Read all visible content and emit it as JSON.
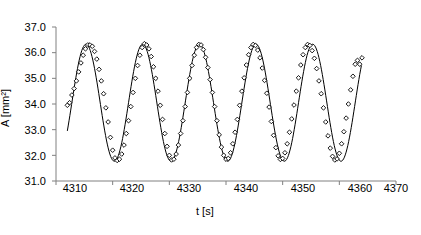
{
  "chart_data": {
    "type": "scatter",
    "title": "",
    "xlabel": "t [s]",
    "ylabel": "A [mm²]",
    "xlim": [
      4310,
      4370
    ],
    "ylim": [
      31.0,
      37.0
    ],
    "xticks": [
      4310,
      4320,
      4330,
      4340,
      4350,
      4360,
      4370
    ],
    "xtick_labels": [
      "4310",
      "4320",
      "4330",
      "4340",
      "4350",
      "4360",
      "4370"
    ],
    "yticks": [
      31.0,
      32.0,
      33.0,
      34.0,
      35.0,
      36.0,
      37.0
    ],
    "ytick_labels": [
      "31.0",
      "32.0",
      "33.0",
      "34.0",
      "35.0",
      "36.0",
      "37.0"
    ],
    "grid": false,
    "legend": "none",
    "series": [
      {
        "name": "measured",
        "marker": "open-diamond",
        "color": "#000000",
        "x": [
          4312.0,
          4312.4,
          4312.8,
          4313.2,
          4313.6,
          4314.0,
          4314.4,
          4314.8,
          4315.2,
          4315.6,
          4316.0,
          4316.4,
          4316.8,
          4317.2,
          4317.6,
          4318.0,
          4318.4,
          4318.8,
          4319.2,
          4319.6,
          4320.0,
          4320.4,
          4320.8,
          4321.2,
          4321.6,
          4322.0,
          4322.4,
          4322.8,
          4323.2,
          4323.6,
          4324.0,
          4324.4,
          4324.8,
          4325.2,
          4325.6,
          4326.0,
          4326.4,
          4326.8,
          4327.2,
          4327.6,
          4328.0,
          4328.4,
          4328.8,
          4329.2,
          4329.6,
          4330.0,
          4330.4,
          4330.8,
          4331.2,
          4331.6,
          4332.0,
          4332.4,
          4332.8,
          4333.2,
          4333.6,
          4334.0,
          4334.4,
          4334.8,
          4335.2,
          4335.6,
          4336.0,
          4336.4,
          4336.8,
          4337.2,
          4337.6,
          4338.0,
          4338.4,
          4338.8,
          4339.2,
          4339.6,
          4340.0,
          4340.4,
          4340.8,
          4341.2,
          4341.6,
          4342.0,
          4342.4,
          4342.8,
          4343.2,
          4343.6,
          4344.0,
          4344.4,
          4344.8,
          4345.2,
          4345.6,
          4346.0,
          4346.4,
          4346.8,
          4347.2,
          4347.6,
          4348.0,
          4348.4,
          4348.8,
          4349.2,
          4349.6,
          4350.0,
          4350.4,
          4350.8,
          4351.2,
          4351.6,
          4352.0,
          4352.4,
          4352.8,
          4353.2,
          4353.6,
          4354.0,
          4354.4,
          4354.8,
          4355.2,
          4355.6,
          4356.0,
          4356.4,
          4356.8,
          4357.2,
          4357.6,
          4358.0,
          4358.4,
          4358.8,
          4359.2,
          4359.6,
          4360.0,
          4360.4,
          4360.8,
          4361.2,
          4361.6,
          4362.0,
          4362.4,
          4362.8,
          4363.2,
          4363.6,
          4364.0
        ],
        "y": [
          33.95,
          34.05,
          34.35,
          34.6,
          34.9,
          35.25,
          35.6,
          35.9,
          36.15,
          36.3,
          36.3,
          36.25,
          36.05,
          35.75,
          35.35,
          34.9,
          34.4,
          33.85,
          33.3,
          32.7,
          32.2,
          31.9,
          31.8,
          31.85,
          32.05,
          32.4,
          32.85,
          33.35,
          33.9,
          34.45,
          35.0,
          35.5,
          35.9,
          36.2,
          36.35,
          36.3,
          36.15,
          35.85,
          35.45,
          35.0,
          34.5,
          33.95,
          33.4,
          32.85,
          32.35,
          32.0,
          31.82,
          31.85,
          32.05,
          32.4,
          32.85,
          33.35,
          33.9,
          34.45,
          35.0,
          35.5,
          35.9,
          36.2,
          36.32,
          36.3,
          36.12,
          35.82,
          35.42,
          34.95,
          34.45,
          33.9,
          33.35,
          32.8,
          32.32,
          32.0,
          31.85,
          31.88,
          32.1,
          32.45,
          32.9,
          33.4,
          33.95,
          34.5,
          35.02,
          35.52,
          35.92,
          36.2,
          36.32,
          36.28,
          36.1,
          35.8,
          35.4,
          34.92,
          34.42,
          33.88,
          33.32,
          32.78,
          32.3,
          31.98,
          31.84,
          31.88,
          32.1,
          32.45,
          32.9,
          33.42,
          33.96,
          34.5,
          35.02,
          35.52,
          35.92,
          36.2,
          36.32,
          36.28,
          36.08,
          35.78,
          35.38,
          34.9,
          34.4,
          33.85,
          33.3,
          32.76,
          32.28,
          31.96,
          31.82,
          31.86,
          32.08,
          32.45,
          32.92,
          33.45,
          34.0,
          34.55,
          35.08,
          35.55,
          35.7,
          35.55,
          35.8
        ]
      },
      {
        "name": "fitted sine",
        "type": "line",
        "color": "#000000",
        "mean": 34.05,
        "amplitude": 2.28,
        "period": 10.0,
        "phase_peak_t": 4315.3
      }
    ]
  }
}
